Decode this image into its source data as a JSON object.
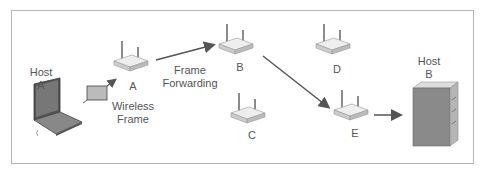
{
  "nodes": {
    "host_a": {
      "line1": "Host",
      "line2": "A"
    },
    "host_b": {
      "line1": "Host",
      "line2": "B"
    },
    "router_a": {
      "label": "A"
    },
    "router_b": {
      "label": "B"
    },
    "router_c": {
      "label": "C"
    },
    "router_d": {
      "label": "D"
    },
    "router_e": {
      "label": "E"
    }
  },
  "annotations": {
    "wireless_frame": {
      "line1": "Wireless",
      "line2": "Frame"
    },
    "frame_forwarding": {
      "line1": "Frame",
      "line2": "Forwarding"
    }
  },
  "colors": {
    "border": "#b5b5b5",
    "arrow": "#555555",
    "device": "#d8d8d8",
    "text": "#555555"
  }
}
